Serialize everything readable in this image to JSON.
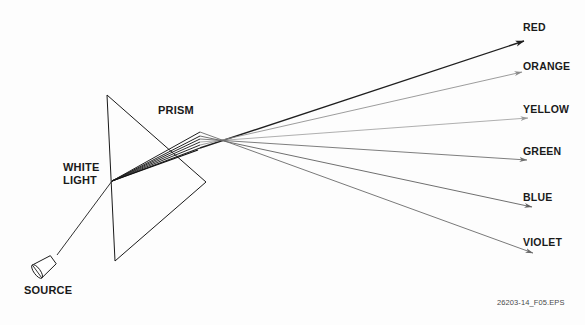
{
  "figure": {
    "footer_code": "26203-14_F05.EPS",
    "background_color": "#fdfdfd",
    "line_color": "#1a1a1a"
  },
  "labels": {
    "prism": "PRISM",
    "white_light_line1": "WHITE",
    "white_light_line2": "LIGHT",
    "source": "SOURCE"
  },
  "spectrum": {
    "entry_point": {
      "x": 112,
      "y": 181
    },
    "exit_point": {
      "x": 200,
      "y": 139
    },
    "rays": [
      {
        "name": "RED",
        "label": "RED",
        "color": "#1f1f1f",
        "stroke_width": 1.35,
        "exit_y": 148,
        "tip_x": 524,
        "tip_y": 41,
        "label_x": 523,
        "label_y": 21
      },
      {
        "name": "ORANGE",
        "label": "ORANGE",
        "color": "#8a8a8a",
        "stroke_width": 0.85,
        "exit_y": 145,
        "tip_x": 522,
        "tip_y": 72,
        "label_x": 523,
        "label_y": 60
      },
      {
        "name": "YELLOW",
        "label": "YELLOW",
        "color": "#9a9a9a",
        "stroke_width": 0.8,
        "exit_y": 142,
        "tip_x": 528,
        "tip_y": 118,
        "label_x": 523,
        "label_y": 103
      },
      {
        "name": "GREEN",
        "label": "GREEN",
        "color": "#6f6f6f",
        "stroke_width": 0.9,
        "exit_y": 139,
        "tip_x": 527,
        "tip_y": 160,
        "label_x": 523,
        "label_y": 145
      },
      {
        "name": "BLUE",
        "label": "BLUE",
        "color": "#5f5f5f",
        "stroke_width": 0.9,
        "exit_y": 136,
        "tip_x": 532,
        "tip_y": 207,
        "label_x": 523,
        "label_y": 191
      },
      {
        "name": "VIOLET",
        "label": "VIOLET",
        "color": "#6a6a6a",
        "stroke_width": 0.9,
        "exit_y": 132,
        "tip_x": 533,
        "tip_y": 253,
        "label_x": 523,
        "label_y": 236
      }
    ]
  },
  "prism": {
    "apex_top": {
      "x": 107,
      "y": 95
    },
    "apex_bottom": {
      "x": 115,
      "y": 261
    },
    "apex_right": {
      "x": 206,
      "y": 182
    }
  },
  "source": {
    "body_center": {
      "x": 46,
      "y": 265
    },
    "beam_start": {
      "x": 57,
      "y": 255
    },
    "beam_end": {
      "x": 112,
      "y": 181
    }
  }
}
